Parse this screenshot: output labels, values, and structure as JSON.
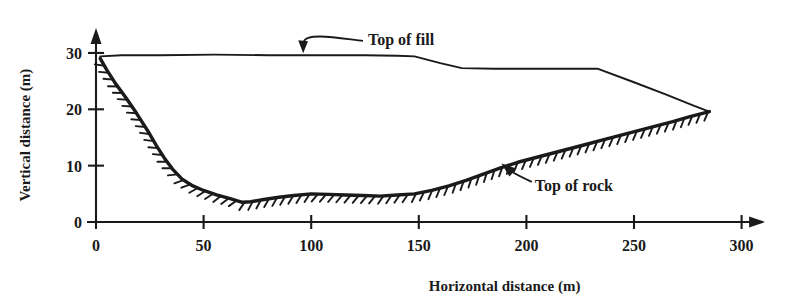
{
  "chart_data": {
    "type": "line",
    "title": "",
    "xlabel": "Horizontal distance (m)",
    "ylabel": "Vertical distance (m)",
    "xlim": [
      0,
      310
    ],
    "ylim": [
      0,
      33
    ],
    "xticks": [
      0,
      50,
      100,
      150,
      200,
      250,
      300
    ],
    "yticks": [
      0,
      10,
      20,
      30
    ],
    "xtick_labels": [
      "0",
      "50",
      "100",
      "150",
      "200",
      "250",
      "300"
    ],
    "ytick_labels": [
      "0",
      "10",
      "20",
      "30"
    ],
    "grid": false,
    "legend": "none",
    "annotations": [
      {
        "text": "Top of fill",
        "x": 125,
        "y": 32.5,
        "points_to_x": 96,
        "points_to_y": 29.6
      },
      {
        "text": "Top of rock",
        "x": 202,
        "y": 6.6,
        "points_to_x": 187,
        "points_to_y": 11.1
      }
    ],
    "series": [
      {
        "name": "Top of fill",
        "points": [
          [
            2,
            29.4
          ],
          [
            12,
            29.6
          ],
          [
            30,
            29.6
          ],
          [
            55,
            29.7
          ],
          [
            80,
            29.6
          ],
          [
            105,
            29.6
          ],
          [
            125,
            29.6
          ],
          [
            140,
            29.5
          ],
          [
            148,
            29.4
          ],
          [
            160,
            28.2
          ],
          [
            170,
            27.3
          ],
          [
            185,
            27.2
          ],
          [
            205,
            27.2
          ],
          [
            225,
            27.2
          ],
          [
            233,
            27.2
          ],
          [
            250,
            24.8
          ],
          [
            265,
            22.6
          ],
          [
            278,
            20.6
          ],
          [
            285,
            19.6
          ]
        ]
      },
      {
        "name": "Top of rock",
        "points": [
          [
            2,
            29.0
          ],
          [
            5,
            27.0
          ],
          [
            9,
            24.6
          ],
          [
            14,
            22.0
          ],
          [
            19,
            19.2
          ],
          [
            24,
            16.2
          ],
          [
            28,
            13.6
          ],
          [
            32,
            11.2
          ],
          [
            36,
            9.2
          ],
          [
            40,
            7.6
          ],
          [
            45,
            6.4
          ],
          [
            50,
            5.6
          ],
          [
            56,
            4.8
          ],
          [
            62,
            4.2
          ],
          [
            68,
            3.5
          ],
          [
            72,
            3.6
          ],
          [
            78,
            4.0
          ],
          [
            85,
            4.4
          ],
          [
            92,
            4.7
          ],
          [
            100,
            5.0
          ],
          [
            108,
            4.9
          ],
          [
            116,
            4.8
          ],
          [
            124,
            4.7
          ],
          [
            132,
            4.6
          ],
          [
            140,
            4.8
          ],
          [
            148,
            5.0
          ],
          [
            156,
            5.6
          ],
          [
            164,
            6.4
          ],
          [
            172,
            7.4
          ],
          [
            180,
            8.5
          ],
          [
            188,
            9.6
          ],
          [
            196,
            10.6
          ],
          [
            204,
            11.4
          ],
          [
            212,
            12.2
          ],
          [
            220,
            13.0
          ],
          [
            228,
            13.8
          ],
          [
            236,
            14.6
          ],
          [
            244,
            15.4
          ],
          [
            252,
            16.2
          ],
          [
            260,
            17.0
          ],
          [
            268,
            17.8
          ],
          [
            276,
            18.7
          ],
          [
            285,
            19.6
          ]
        ]
      }
    ]
  },
  "figure": {
    "axis_x_label": "Horizontal distance (m)",
    "axis_y_label": "Vertical distance (m)",
    "fill_annotation": "Top of fill",
    "rock_annotation": "Top of rock",
    "line_color": "#1a1a1a",
    "background_color": "#ffffff"
  }
}
